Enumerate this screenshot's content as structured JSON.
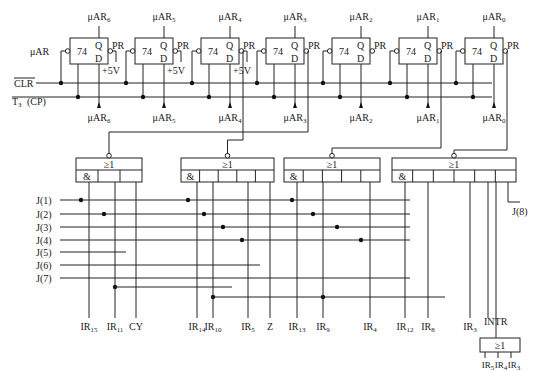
{
  "diagram": {
    "flipflops": [
      {
        "id": "ff6",
        "x": 70,
        "q": "μAR",
        "qsub": "6",
        "out": "μAR",
        "outsub": "6",
        "chip": "74",
        "q_pin": "Q",
        "d_pin": "D",
        "pr": "PR",
        "vcc": "+5V",
        "left": "μAR"
      },
      {
        "id": "ff5",
        "x": 135,
        "q": "μAR",
        "qsub": "5",
        "out": "μAR",
        "outsub": "5",
        "chip": "74",
        "q_pin": "Q",
        "d_pin": "D",
        "pr": "PR",
        "vcc": "+5V"
      },
      {
        "id": "ff4",
        "x": 201,
        "q": "μAR",
        "qsub": "4",
        "out": "μAR",
        "outsub": "4",
        "chip": "74",
        "q_pin": "Q",
        "d_pin": "D",
        "pr": "PR",
        "vcc": "+5V"
      },
      {
        "id": "ff3",
        "x": 266,
        "q": "μAR",
        "qsub": "3",
        "out": "μAR",
        "outsub": "3",
        "chip": "74",
        "q_pin": "Q",
        "d_pin": "D",
        "pr": "PR"
      },
      {
        "id": "ff2",
        "x": 332,
        "q": "μAR",
        "qsub": "2",
        "out": "μAR",
        "outsub": "2",
        "chip": "74",
        "q_pin": "Q",
        "d_pin": "D",
        "pr": "PR"
      },
      {
        "id": "ff1",
        "x": 399,
        "q": "μAR",
        "qsub": "1",
        "out": "μAR",
        "outsub": "1",
        "chip": "74",
        "q_pin": "Q",
        "d_pin": "D",
        "pr": "PR"
      },
      {
        "id": "ff0",
        "x": 465,
        "q": "μAR",
        "qsub": "0",
        "out": "μAR",
        "outsub": "0",
        "chip": "74",
        "q_pin": "Q",
        "d_pin": "D",
        "pr": "PR"
      }
    ],
    "buses": {
      "clr": "CLR",
      "clk": "T",
      "clk_sub": "3",
      "clk_suffix": "(CP)"
    },
    "gates": [
      {
        "id": "g1",
        "x": 76,
        "w": 66,
        "or": "≥1",
        "and": "&",
        "cells": 3
      },
      {
        "id": "g2",
        "x": 181,
        "w": 93,
        "or": "≥1",
        "and": "&",
        "cells": 5
      },
      {
        "id": "g3",
        "x": 284,
        "w": 96,
        "or": "≥1",
        "and": "&",
        "cells": 5
      },
      {
        "id": "g4",
        "x": 392,
        "w": 124,
        "or": "≥1",
        "and": "&",
        "cells": 6
      }
    ],
    "j_inputs": [
      "J(1)",
      "J(2)",
      "J(3)",
      "J(4)",
      "J(5)",
      "J(6)",
      "J(7)"
    ],
    "j8": "J(8)",
    "bottom_labels": [
      {
        "t": "IR",
        "s": "15",
        "x": 89
      },
      {
        "t": "IR",
        "s": "11",
        "x": 115
      },
      {
        "t": "CY",
        "s": "",
        "x": 136
      },
      {
        "t": "IR",
        "s": "14",
        "x": 197
      },
      {
        "t": "IR",
        "s": "10",
        "x": 213
      },
      {
        "t": "IR",
        "s": "5",
        "x": 248
      },
      {
        "t": "Z",
        "s": "",
        "x": 270
      },
      {
        "t": "IR",
        "s": "13",
        "x": 297
      },
      {
        "t": "IR",
        "s": "9",
        "x": 323
      },
      {
        "t": "IR",
        "s": "4",
        "x": 370
      },
      {
        "t": "IR",
        "s": "12",
        "x": 405
      },
      {
        "t": "IR",
        "s": "8",
        "x": 428
      },
      {
        "t": "IR",
        "s": "3",
        "x": 470
      }
    ],
    "intr": "INTR",
    "small_gate": {
      "or": "≥1",
      "inputs": [
        {
          "t": "IR",
          "s": "5"
        },
        {
          "t": "IR",
          "s": "4"
        },
        {
          "t": "IR",
          "s": "3"
        }
      ]
    }
  }
}
